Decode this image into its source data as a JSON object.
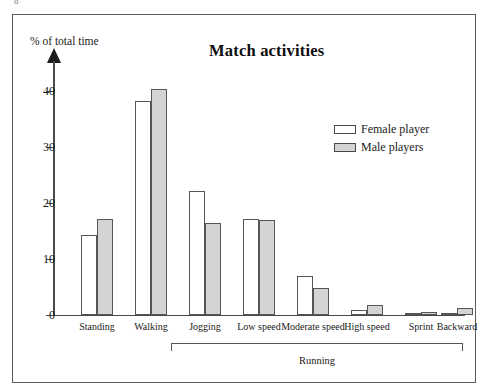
{
  "figure": {
    "caption": "o"
  },
  "chart_data": {
    "type": "bar",
    "title": "Match activities",
    "xlabel": "",
    "ylabel": "% of total time",
    "ylim": [
      0,
      44
    ],
    "yticks": [
      0,
      10,
      20,
      30,
      40
    ],
    "grid": false,
    "legend_position": "upper-right-inside",
    "categories": [
      "Standing",
      "Walking",
      "Jogging",
      "Low speed",
      "Moderate speed",
      "High speed",
      "Sprint",
      "Backward"
    ],
    "group_bracket": {
      "label": "Running",
      "spans": [
        "Jogging",
        "Low speed",
        "Moderate speed",
        "High speed",
        "Sprint",
        "Backward"
      ]
    },
    "series": [
      {
        "name": "Female player",
        "color": "#ffffff",
        "values": [
          14.2,
          38.2,
          22.2,
          17.1,
          7.0,
          0.9,
          0.2,
          0.3
        ]
      },
      {
        "name": "Male players",
        "color": "#d4d4d4",
        "values": [
          17.2,
          40.3,
          16.5,
          16.9,
          4.9,
          1.7,
          0.5,
          1.2
        ]
      }
    ]
  }
}
